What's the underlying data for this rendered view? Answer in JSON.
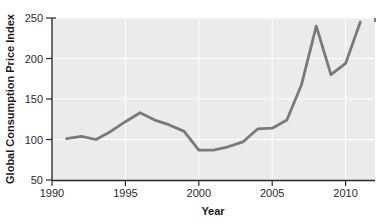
{
  "chart_data": {
    "type": "line",
    "title": "",
    "xlabel": "Year",
    "ylabel": "Global Consumption Price Index",
    "xlim": [
      1990,
      2012
    ],
    "ylim": [
      50,
      250
    ],
    "xticks": [
      1990,
      1995,
      2000,
      2005,
      2010
    ],
    "yticks": [
      50,
      100,
      150,
      200,
      250
    ],
    "xtick_labels": [
      "1990",
      "1995",
      "2000",
      "2005",
      "2010"
    ],
    "ytick_labels": [
      "50",
      "100",
      "150",
      "200",
      "250"
    ],
    "grid": true,
    "legend": false,
    "series": [
      {
        "name": "Global Consumption Price Index",
        "color": "#7a7a7a",
        "x": [
          1991,
          1992,
          1993,
          1994,
          1995,
          1996,
          1997,
          1998,
          1999,
          2000,
          2001,
          2002,
          2003,
          2004,
          2005,
          2006,
          2007,
          2008,
          2009,
          2010,
          2011
        ],
        "values": [
          101,
          104,
          100,
          110,
          122,
          133,
          124,
          118,
          110,
          87,
          87,
          91,
          97,
          113,
          114,
          124,
          168,
          240,
          180,
          194,
          245
        ]
      }
    ],
    "plot_bg": "#ebebeb",
    "grid_color": "#ffffff",
    "axis_color": "#2b2b2b"
  },
  "labels": {
    "ylabel": "Global Consumption Price Index",
    "xlabel": "Year",
    "y_50": "50",
    "y_100": "100",
    "y_150": "150",
    "y_200": "200",
    "y_250": "250",
    "x_1990": "1990",
    "x_1995": "1995",
    "x_2000": "2000",
    "x_2005": "2005",
    "x_2010": "2010"
  }
}
